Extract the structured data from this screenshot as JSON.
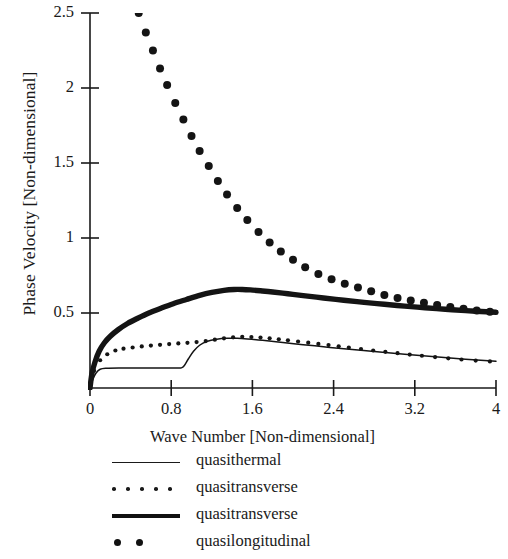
{
  "chart_data": {
    "type": "line",
    "title": "",
    "xlabel": "Wave Number [Non-dimensional]",
    "ylabel": "Phase Velocity [Non-dimensional]",
    "xlim": [
      0,
      4
    ],
    "ylim": [
      0,
      2.5
    ],
    "xticks": [
      "0",
      "0.8",
      "1.6",
      "2.4",
      "3.2",
      "4"
    ],
    "xtick_values": [
      0,
      0.8,
      1.6,
      2.4,
      3.2,
      4
    ],
    "yticks": [
      "0.5",
      "1",
      "1.5",
      "2",
      "2.5"
    ],
    "ytick_values": [
      0.5,
      1,
      1.5,
      2,
      2.5
    ],
    "grid": false,
    "legend_position": "below-axis",
    "series": [
      {
        "name": "quasithermal",
        "style": "thin-line",
        "x": [
          0,
          0.03,
          0.06,
          0.1,
          0.16,
          0.3,
          0.5,
          0.7,
          0.85,
          0.9,
          0.93,
          0.97,
          1.02,
          1.08,
          1.15,
          1.25,
          1.35,
          1.45,
          1.55,
          1.7,
          1.9,
          2.1,
          2.3,
          2.5,
          2.8,
          3.1,
          3.4,
          3.7,
          4
        ],
        "y": [
          0.0,
          0.06,
          0.1,
          0.125,
          0.132,
          0.134,
          0.134,
          0.134,
          0.134,
          0.134,
          0.15,
          0.195,
          0.245,
          0.285,
          0.31,
          0.325,
          0.331,
          0.331,
          0.327,
          0.318,
          0.303,
          0.289,
          0.275,
          0.262,
          0.243,
          0.225,
          0.208,
          0.192,
          0.178
        ]
      },
      {
        "name": "quasitransverse",
        "style": "small-dots",
        "x": [
          0.04,
          0.1,
          0.17,
          0.25,
          0.33,
          0.42,
          0.51,
          0.6,
          0.69,
          0.78,
          0.87,
          0.96,
          1.05,
          1.14,
          1.23,
          1.32,
          1.41,
          1.5,
          1.59,
          1.68,
          1.77,
          1.86,
          1.95,
          2.05,
          2.15,
          2.25,
          2.35,
          2.45,
          2.55,
          2.67,
          2.79,
          2.91,
          3.03,
          3.15,
          3.27,
          3.4,
          3.53,
          3.66,
          3.8,
          3.94
        ],
        "y": [
          0.115,
          0.185,
          0.225,
          0.25,
          0.262,
          0.27,
          0.277,
          0.283,
          0.288,
          0.293,
          0.297,
          0.301,
          0.306,
          0.313,
          0.322,
          0.331,
          0.338,
          0.341,
          0.34,
          0.336,
          0.331,
          0.325,
          0.318,
          0.31,
          0.302,
          0.294,
          0.286,
          0.278,
          0.27,
          0.26,
          0.25,
          0.241,
          0.232,
          0.223,
          0.215,
          0.206,
          0.198,
          0.19,
          0.183,
          0.177
        ]
      },
      {
        "name": "quasitransverse",
        "style": "thick-line",
        "x": [
          0,
          0.02,
          0.05,
          0.09,
          0.14,
          0.2,
          0.28,
          0.37,
          0.47,
          0.58,
          0.7,
          0.82,
          0.95,
          1.08,
          1.2,
          1.32,
          1.42,
          1.5,
          1.58,
          1.68,
          1.8,
          1.95,
          2.1,
          2.3,
          2.5,
          2.7,
          2.9,
          3.1,
          3.3,
          3.5,
          3.7,
          3.85,
          4
        ],
        "y": [
          0.0,
          0.1,
          0.175,
          0.245,
          0.3,
          0.345,
          0.39,
          0.43,
          0.465,
          0.5,
          0.532,
          0.562,
          0.59,
          0.617,
          0.637,
          0.651,
          0.657,
          0.657,
          0.654,
          0.648,
          0.64,
          0.628,
          0.616,
          0.6,
          0.585,
          0.571,
          0.558,
          0.546,
          0.535,
          0.525,
          0.516,
          0.51,
          0.505
        ]
      },
      {
        "name": "quasilongitudinal",
        "style": "large-dots",
        "x": [
          0.48,
          0.55,
          0.62,
          0.69,
          0.76,
          0.84,
          0.92,
          1.0,
          1.08,
          1.17,
          1.26,
          1.35,
          1.45,
          1.55,
          1.66,
          1.77,
          1.88,
          2.0,
          2.12,
          2.25,
          2.38,
          2.51,
          2.64,
          2.77,
          2.9,
          3.03,
          3.16,
          3.29,
          3.42,
          3.55,
          3.68,
          3.81,
          3.94
        ],
        "y": [
          2.5,
          2.37,
          2.25,
          2.13,
          2.02,
          1.9,
          1.79,
          1.68,
          1.58,
          1.48,
          1.38,
          1.29,
          1.2,
          1.12,
          1.04,
          0.97,
          0.91,
          0.855,
          0.805,
          0.76,
          0.725,
          0.695,
          0.67,
          0.645,
          0.62,
          0.6,
          0.583,
          0.568,
          0.553,
          0.54,
          0.528,
          0.517,
          0.508
        ]
      }
    ]
  },
  "legend": {
    "entries": [
      {
        "label": "quasithermal",
        "key": "thin-line"
      },
      {
        "label": "quasitransverse",
        "key": "small-dots"
      },
      {
        "label": "quasitransverse",
        "key": "thick-line"
      },
      {
        "label": "quasilongitudinal",
        "key": "large-dots"
      }
    ]
  }
}
